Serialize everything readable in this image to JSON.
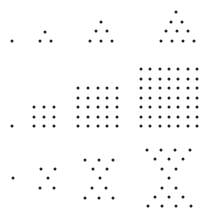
{
  "diagram": {
    "dot_color": "#222222",
    "background": "#ffffff",
    "rows": [
      {
        "name": "triangular-numbers",
        "figures": [
          {
            "count": 1,
            "dots": [
              [
                12,
                41
              ]
            ]
          },
          {
            "count": 3,
            "dots": [
              [
                40,
                41
              ],
              [
                51,
                41
              ],
              [
                45,
                32
              ]
            ]
          },
          {
            "count": 6,
            "dots": [
              [
                90,
                41
              ],
              [
                101,
                41
              ],
              [
                112,
                41
              ],
              [
                96,
                31
              ],
              [
                107,
                31
              ],
              [
                101,
                22
              ]
            ]
          },
          {
            "count": 10,
            "dots": [
              [
                161,
                41
              ],
              [
                172,
                41
              ],
              [
                183,
                41
              ],
              [
                194,
                41
              ],
              [
                166,
                31
              ],
              [
                177,
                31
              ],
              [
                188,
                31
              ],
              [
                171,
                22
              ],
              [
                182,
                22
              ],
              [
                176,
                12
              ]
            ]
          }
        ]
      },
      {
        "name": "square-numbers",
        "figures": [
          {
            "count": 1,
            "dots": [
              [
                12,
                126
              ]
            ]
          },
          {
            "count": 9,
            "grid": {
              "x0": 34,
              "y0": 107,
              "dx": 10,
              "dy": 9.5,
              "n": 3
            }
          },
          {
            "count": 25,
            "grid": {
              "x0": 78,
              "y0": 88,
              "dx": 9.75,
              "dy": 9.5,
              "n": 5
            }
          },
          {
            "count": 49,
            "grid": {
              "x0": 141,
              "y0": 69,
              "dx": 9.33,
              "dy": 9.5,
              "n": 7
            }
          }
        ]
      },
      {
        "name": "hourglass-numbers",
        "figures": [
          {
            "count": 1,
            "dots": [
              [
                13,
                178
              ]
            ]
          },
          {
            "count": 5,
            "dots": [
              [
                41,
                169
              ],
              [
                55,
                169
              ],
              [
                48,
                178
              ],
              [
                40,
                188
              ],
              [
                54,
                188
              ]
            ]
          },
          {
            "count": 11,
            "dots": [
              [
                85,
                160
              ],
              [
                99,
                160
              ],
              [
                113,
                160
              ],
              [
                93,
                169
              ],
              [
                107,
                169
              ],
              [
                100,
                178
              ],
              [
                92,
                188
              ],
              [
                106,
                188
              ],
              [
                85,
                198
              ],
              [
                99,
                198
              ],
              [
                113,
                198
              ]
            ]
          },
          {
            "count": 19,
            "dots": [
              [
                147,
                150
              ],
              [
                161,
                150
              ],
              [
                175,
                150
              ],
              [
                190,
                150
              ],
              [
                155,
                159
              ],
              [
                169,
                159
              ],
              [
                183,
                159
              ],
              [
                162,
                169
              ],
              [
                176,
                169
              ],
              [
                169,
                178
              ],
              [
                162,
                188
              ],
              [
                176,
                188
              ],
              [
                155,
                197
              ],
              [
                169,
                197
              ],
              [
                183,
                197
              ],
              [
                148,
                206
              ],
              [
                162,
                206
              ],
              [
                176,
                206
              ],
              [
                191,
                206
              ]
            ]
          }
        ]
      }
    ]
  }
}
